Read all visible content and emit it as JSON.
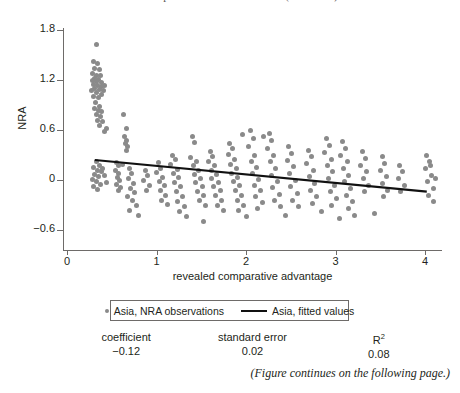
{
  "figure": {
    "cut_title": "fitted values of the relationship between NRA and RCA (continued)",
    "footnote": "(Figure continues on the following page.)"
  },
  "legend": {
    "observations_label": "Asia, NRA observations",
    "fitted_label": "Asia, fitted values",
    "marker_icon": "dot-marker-icon",
    "line_icon": "line-marker-icon"
  },
  "stats": [
    {
      "key": "coefficient",
      "value": "−0.12"
    },
    {
      "key": "standard error",
      "value": "0.02"
    },
    {
      "key": "R",
      "sup": "2",
      "value": "0.08"
    }
  ],
  "colors": {
    "point": "#8a8a8a",
    "fit_line": "#111111",
    "axis": "#6e6b69",
    "text": "#231f20",
    "background": "#ffffff"
  },
  "chart_data": {
    "type": "scatter",
    "title": "",
    "xlabel": "revealed comparative advantage",
    "ylabel": "NRA",
    "xlim": [
      0,
      4.2
    ],
    "ylim": [
      -0.6,
      1.8
    ],
    "xticks": [
      0,
      1,
      2,
      3,
      4
    ],
    "xticklabels": [
      "0",
      "1",
      "2",
      "3",
      "4"
    ],
    "yticks": [
      -0.6,
      0,
      0.6,
      1.2,
      1.8
    ],
    "yticklabels": [
      "−0.6",
      "0",
      "0.6",
      "1.2",
      "1.8"
    ],
    "grid": false,
    "legend_position": "below-axes",
    "series": [
      {
        "name": "Asia, NRA observations",
        "type": "scatter",
        "color": "#8a8a8a",
        "marker": "circle",
        "points": [
          [
            0.33,
            1.63
          ],
          [
            0.3,
            1.42
          ],
          [
            0.34,
            1.4
          ],
          [
            0.31,
            1.34
          ],
          [
            0.36,
            1.33
          ],
          [
            0.29,
            1.28
          ],
          [
            0.33,
            1.26
          ],
          [
            0.37,
            1.25
          ],
          [
            0.31,
            1.22
          ],
          [
            0.35,
            1.21
          ],
          [
            0.28,
            1.19
          ],
          [
            0.33,
            1.18
          ],
          [
            0.38,
            1.17
          ],
          [
            0.3,
            1.15
          ],
          [
            0.34,
            1.14
          ],
          [
            0.39,
            1.12
          ],
          [
            0.31,
            1.1
          ],
          [
            0.36,
            1.09
          ],
          [
            0.27,
            1.07
          ],
          [
            0.33,
            1.05
          ],
          [
            0.38,
            1.03
          ],
          [
            0.3,
            1.0
          ],
          [
            0.35,
            0.99
          ],
          [
            0.41,
            1.08
          ],
          [
            0.42,
            1.13
          ],
          [
            0.32,
            0.93
          ],
          [
            0.36,
            0.88
          ],
          [
            0.31,
            0.86
          ],
          [
            0.35,
            0.83
          ],
          [
            0.39,
            0.82
          ],
          [
            0.33,
            0.79
          ],
          [
            0.37,
            0.76
          ],
          [
            0.34,
            0.72
          ],
          [
            0.4,
            0.7
          ],
          [
            0.36,
            0.66
          ],
          [
            0.44,
            0.62
          ],
          [
            0.42,
            0.58
          ],
          [
            0.63,
            0.79
          ],
          [
            0.66,
            0.62
          ],
          [
            0.64,
            0.52
          ],
          [
            0.67,
            0.48
          ],
          [
            0.65,
            0.44
          ],
          [
            0.68,
            0.4
          ],
          [
            0.66,
            0.35
          ],
          [
            0.33,
            0.22
          ],
          [
            0.36,
            0.18
          ],
          [
            0.3,
            0.15
          ],
          [
            0.34,
            0.12
          ],
          [
            0.38,
            0.1
          ],
          [
            0.31,
            0.07
          ],
          [
            0.35,
            0.04
          ],
          [
            0.28,
            0.01
          ],
          [
            0.33,
            -0.02
          ],
          [
            0.37,
            -0.05
          ],
          [
            0.3,
            -0.08
          ],
          [
            0.34,
            -0.11
          ],
          [
            0.4,
            0.14
          ],
          [
            0.42,
            0.06
          ],
          [
            0.44,
            -0.03
          ],
          [
            0.55,
            0.21
          ],
          [
            0.57,
            0.17
          ],
          [
            0.54,
            0.12
          ],
          [
            0.58,
            0.08
          ],
          [
            0.56,
            0.03
          ],
          [
            0.59,
            -0.01
          ],
          [
            0.55,
            -0.05
          ],
          [
            0.6,
            -0.09
          ],
          [
            0.57,
            -0.13
          ],
          [
            0.62,
            0.19
          ],
          [
            0.7,
            0.14
          ],
          [
            0.72,
            0.08
          ],
          [
            0.69,
            0.02
          ],
          [
            0.74,
            -0.04
          ],
          [
            0.71,
            -0.1
          ],
          [
            0.75,
            -0.15
          ],
          [
            0.68,
            -0.2
          ],
          [
            0.73,
            -0.25
          ],
          [
            0.78,
            -0.3
          ],
          [
            0.7,
            -0.36
          ],
          [
            0.88,
            0.12
          ],
          [
            0.9,
            0.06
          ],
          [
            0.86,
            0.0
          ],
          [
            0.92,
            -0.06
          ],
          [
            0.89,
            -0.12
          ],
          [
            1.02,
            0.21
          ],
          [
            1.05,
            0.14
          ],
          [
            1.0,
            0.09
          ],
          [
            1.07,
            0.03
          ],
          [
            1.03,
            -0.02
          ],
          [
            1.09,
            -0.07
          ],
          [
            1.04,
            -0.13
          ],
          [
            1.1,
            -0.19
          ],
          [
            1.06,
            -0.24
          ],
          [
            1.12,
            -0.29
          ],
          [
            1.18,
            0.3
          ],
          [
            1.21,
            0.25
          ],
          [
            1.16,
            0.19
          ],
          [
            1.23,
            0.13
          ],
          [
            1.19,
            0.08
          ],
          [
            1.25,
            0.03
          ],
          [
            1.2,
            -0.03
          ],
          [
            1.27,
            -0.08
          ],
          [
            1.22,
            -0.14
          ],
          [
            1.29,
            -0.2
          ],
          [
            1.24,
            -0.26
          ],
          [
            1.31,
            -0.32
          ],
          [
            1.26,
            -0.38
          ],
          [
            1.33,
            -0.44
          ],
          [
            1.4,
            0.52
          ],
          [
            1.43,
            0.45
          ],
          [
            1.38,
            0.27
          ],
          [
            1.45,
            0.22
          ],
          [
            1.41,
            0.17
          ],
          [
            1.47,
            0.12
          ],
          [
            1.42,
            0.07
          ],
          [
            1.49,
            0.02
          ],
          [
            1.44,
            -0.03
          ],
          [
            1.51,
            -0.08
          ],
          [
            1.46,
            -0.14
          ],
          [
            1.53,
            -0.19
          ],
          [
            1.48,
            -0.25
          ],
          [
            1.55,
            -0.31
          ],
          [
            1.6,
            0.34
          ],
          [
            1.63,
            0.28
          ],
          [
            1.58,
            0.22
          ],
          [
            1.65,
            0.17
          ],
          [
            1.61,
            0.12
          ],
          [
            1.67,
            0.07
          ],
          [
            1.62,
            0.02
          ],
          [
            1.69,
            -0.03
          ],
          [
            1.64,
            -0.08
          ],
          [
            1.71,
            -0.13
          ],
          [
            1.66,
            -0.19
          ],
          [
            1.73,
            -0.24
          ],
          [
            1.68,
            -0.3
          ],
          [
            1.75,
            -0.36
          ],
          [
            1.82,
            0.44
          ],
          [
            1.85,
            0.38
          ],
          [
            1.8,
            0.31
          ],
          [
            1.87,
            0.25
          ],
          [
            1.83,
            0.19
          ],
          [
            1.89,
            0.14
          ],
          [
            1.84,
            0.08
          ],
          [
            1.91,
            0.03
          ],
          [
            1.86,
            -0.02
          ],
          [
            1.93,
            -0.07
          ],
          [
            1.88,
            -0.13
          ],
          [
            1.95,
            -0.18
          ],
          [
            1.9,
            -0.24
          ],
          [
            1.97,
            -0.3
          ],
          [
            1.92,
            -0.36
          ],
          [
            2.05,
            0.6
          ],
          [
            2.08,
            0.5
          ],
          [
            2.03,
            0.4
          ],
          [
            2.1,
            0.3
          ],
          [
            2.06,
            0.22
          ],
          [
            2.12,
            0.15
          ],
          [
            2.07,
            0.08
          ],
          [
            2.14,
            0.01
          ],
          [
            2.09,
            -0.06
          ],
          [
            2.16,
            -0.13
          ],
          [
            2.11,
            -0.2
          ],
          [
            2.18,
            -0.27
          ],
          [
            2.13,
            -0.34
          ],
          [
            2.26,
            0.56
          ],
          [
            2.29,
            0.47
          ],
          [
            2.24,
            0.38
          ],
          [
            2.31,
            0.3
          ],
          [
            2.27,
            0.22
          ],
          [
            2.33,
            0.14
          ],
          [
            2.28,
            0.06
          ],
          [
            2.35,
            -0.02
          ],
          [
            2.3,
            -0.09
          ],
          [
            2.37,
            -0.17
          ],
          [
            2.32,
            -0.25
          ],
          [
            2.39,
            -0.32
          ],
          [
            2.48,
            0.4
          ],
          [
            2.51,
            0.32
          ],
          [
            2.46,
            0.24
          ],
          [
            2.53,
            0.16
          ],
          [
            2.49,
            0.08
          ],
          [
            2.55,
            0.0
          ],
          [
            2.5,
            -0.08
          ],
          [
            2.57,
            -0.16
          ],
          [
            2.52,
            -0.24
          ],
          [
            2.59,
            -0.32
          ],
          [
            2.7,
            0.36
          ],
          [
            2.73,
            0.28
          ],
          [
            2.68,
            0.2
          ],
          [
            2.75,
            0.12
          ],
          [
            2.71,
            0.04
          ],
          [
            2.77,
            -0.04
          ],
          [
            2.72,
            -0.12
          ],
          [
            2.79,
            -0.2
          ],
          [
            2.74,
            -0.28
          ],
          [
            2.9,
            0.5
          ],
          [
            2.93,
            0.42
          ],
          [
            2.88,
            0.33
          ],
          [
            2.95,
            0.25
          ],
          [
            2.91,
            0.17
          ],
          [
            2.97,
            0.1
          ],
          [
            2.92,
            0.02
          ],
          [
            2.99,
            -0.06
          ],
          [
            2.94,
            -0.14
          ],
          [
            3.01,
            -0.22
          ],
          [
            2.96,
            -0.3
          ],
          [
            3.08,
            0.46
          ],
          [
            3.11,
            0.38
          ],
          [
            3.06,
            0.3
          ],
          [
            3.13,
            0.22
          ],
          [
            3.09,
            0.14
          ],
          [
            3.15,
            0.06
          ],
          [
            3.1,
            -0.02
          ],
          [
            3.17,
            -0.1
          ],
          [
            3.12,
            -0.18
          ],
          [
            3.19,
            -0.26
          ],
          [
            3.14,
            -0.34
          ],
          [
            3.21,
            -0.42
          ],
          [
            3.3,
            0.34
          ],
          [
            3.33,
            0.26
          ],
          [
            3.28,
            0.18
          ],
          [
            3.35,
            0.1
          ],
          [
            3.31,
            0.02
          ],
          [
            3.37,
            -0.06
          ],
          [
            3.32,
            -0.14
          ],
          [
            3.52,
            0.28
          ],
          [
            3.55,
            0.2
          ],
          [
            3.5,
            0.12
          ],
          [
            3.57,
            0.04
          ],
          [
            3.53,
            -0.04
          ],
          [
            3.58,
            -0.12
          ],
          [
            3.54,
            -0.2
          ],
          [
            3.72,
            0.18
          ],
          [
            3.75,
            0.1
          ],
          [
            3.7,
            0.02
          ],
          [
            3.77,
            -0.06
          ],
          [
            3.73,
            -0.14
          ],
          [
            4.02,
            0.3
          ],
          [
            4.05,
            0.22
          ],
          [
            4.0,
            0.14
          ],
          [
            4.07,
            0.06
          ],
          [
            4.03,
            -0.02
          ],
          [
            4.09,
            -0.1
          ],
          [
            4.04,
            -0.18
          ],
          [
            4.1,
            -0.26
          ],
          [
            4.06,
            0.18
          ],
          [
            4.12,
            0.02
          ],
          [
            0.8,
            -0.42
          ],
          [
            1.52,
            -0.5
          ],
          [
            2.0,
            -0.44
          ],
          [
            2.44,
            -0.42
          ],
          [
            3.04,
            -0.46
          ],
          [
            2.84,
            -0.38
          ],
          [
            1.96,
            0.55
          ],
          [
            2.2,
            0.52
          ],
          [
            3.44,
            -0.4
          ]
        ]
      },
      {
        "name": "Asia, fitted values",
        "type": "line",
        "color": "#111111",
        "x": [
          0.31,
          4.02
        ],
        "y": [
          0.24,
          -0.14
        ],
        "slope": -0.12,
        "intercept": 0.277
      }
    ]
  }
}
